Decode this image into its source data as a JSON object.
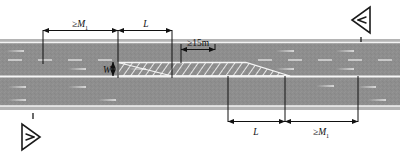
{
  "figure": {
    "type": "road-work-zone-layout-diagram",
    "title": "",
    "background_color": "#ffffff",
    "pavement_color": "#8e8e8e",
    "shoulder_color": "#9a9a9a",
    "edge_line_color": "#f2f2f2",
    "marking_color": "#ffffff",
    "dimension_color": "#111111",
    "hatch_color": "#ffffff"
  },
  "dimensions": {
    "top": [
      {
        "id": "top-m1",
        "label_prefix": "≥",
        "label_symbol": "M",
        "label_sub": "1",
        "full_text": "≥M₁"
      },
      {
        "id": "top-l",
        "label_prefix": "",
        "label_symbol": "L",
        "label_sub": "",
        "full_text": "L"
      }
    ],
    "inner": [
      {
        "id": "clear-15m",
        "full_text": "≥15m",
        "label_prefix": "≥",
        "label_symbol": "15m",
        "label_sub": ""
      },
      {
        "id": "width-w",
        "full_text": "W",
        "label_prefix": "",
        "label_symbol": "W",
        "label_sub": ""
      }
    ],
    "bottom": [
      {
        "id": "bottom-l",
        "label_prefix": "",
        "label_symbol": "L",
        "label_sub": "",
        "full_text": "L"
      },
      {
        "id": "bottom-m1",
        "label_prefix": "≥",
        "label_symbol": "M",
        "label_sub": "1",
        "full_text": "≥M₁"
      }
    ]
  },
  "flow_markers": [
    {
      "id": "marker-top-right",
      "direction": "left",
      "icon": "triangle-left-flow-icon",
      "tick": true
    },
    {
      "id": "marker-bottom-left",
      "direction": "right",
      "icon": "triangle-right-flow-icon",
      "tick": true
    }
  ],
  "carriageways": [
    {
      "id": "upper-carriageway",
      "travel_direction": "leftward",
      "arrow_icon": "lane-arrow-left-icon",
      "lanes": 2
    },
    {
      "id": "lower-carriageway",
      "travel_direction": "rightward",
      "arrow_icon": "lane-arrow-right-icon",
      "lanes": 2
    }
  ],
  "work_zone": {
    "id": "hatched-work-zone",
    "description": "tapered closed lane",
    "hatch_pattern": "diagonal-lines"
  }
}
